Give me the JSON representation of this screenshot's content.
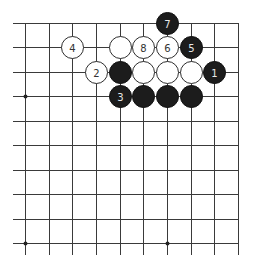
{
  "diagram": {
    "type": "go-board-fragment",
    "grid": {
      "columns": 10,
      "rows": 10,
      "origin_x": 25,
      "origin_y": 23,
      "spacing_x": 23.67,
      "spacing_y": 24.44,
      "top_edge": true,
      "right_edge": true,
      "left_extend_to": 13,
      "bottom_extend_to": 255,
      "line_color": "#3a3a3a"
    },
    "star_points": [
      {
        "col": 0,
        "row": 3
      },
      {
        "col": 0,
        "row": 9
      },
      {
        "col": 6,
        "row": 9
      }
    ],
    "stones": [
      {
        "col": 6,
        "row": 0,
        "color": "black",
        "label": "7"
      },
      {
        "col": 2,
        "row": 1,
        "color": "white",
        "label": "4"
      },
      {
        "col": 4,
        "row": 1,
        "color": "white",
        "label": ""
      },
      {
        "col": 5,
        "row": 1,
        "color": "white",
        "label": "8"
      },
      {
        "col": 6,
        "row": 1,
        "color": "white",
        "label": "6"
      },
      {
        "col": 7,
        "row": 1,
        "color": "black",
        "label": "5"
      },
      {
        "col": 3,
        "row": 2,
        "color": "white",
        "label": "2"
      },
      {
        "col": 4,
        "row": 2,
        "color": "black",
        "label": ""
      },
      {
        "col": 5,
        "row": 2,
        "color": "white",
        "label": ""
      },
      {
        "col": 6,
        "row": 2,
        "color": "white",
        "label": ""
      },
      {
        "col": 7,
        "row": 2,
        "color": "white",
        "label": ""
      },
      {
        "col": 8,
        "row": 2,
        "color": "black",
        "label": "1"
      },
      {
        "col": 4,
        "row": 3,
        "color": "black",
        "label": "3"
      },
      {
        "col": 5,
        "row": 3,
        "color": "black",
        "label": ""
      },
      {
        "col": 6,
        "row": 3,
        "color": "black",
        "label": ""
      },
      {
        "col": 7,
        "row": 3,
        "color": "black",
        "label": ""
      }
    ],
    "stone_radius": 11,
    "colors": {
      "black_stone": "#1c1c1c",
      "white_stone": "#ffffff",
      "white_outline": "#2e2e2e",
      "label_on_black": "#e8e8e8",
      "label_on_white": "#333333"
    }
  }
}
